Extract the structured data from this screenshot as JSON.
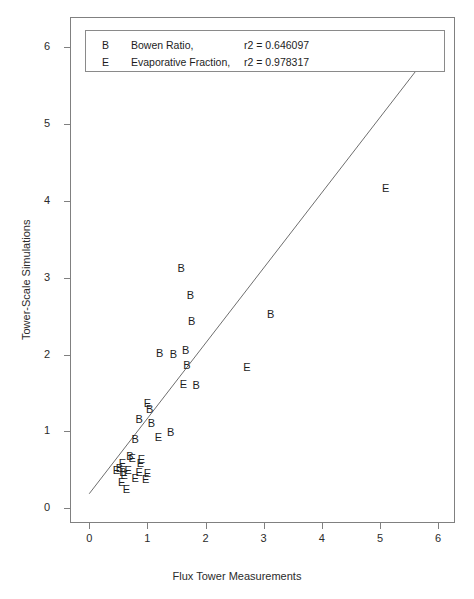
{
  "chart_data": {
    "type": "scatter",
    "title": "",
    "xlabel": "Flux Tower Measurements",
    "ylabel": "Tower-Scale Simulations",
    "xlim": [
      -0.33,
      6.29
    ],
    "ylim": [
      -0.19,
      6.39
    ],
    "xticks": [
      0,
      1,
      2,
      3,
      4,
      5,
      6
    ],
    "yticks": [
      0,
      1,
      2,
      3,
      4,
      5,
      6
    ],
    "xticklabels": [
      "0",
      "1",
      "2",
      "3",
      "4",
      "5",
      "6"
    ],
    "yticklabels": [
      "0",
      "1",
      "2",
      "3",
      "4",
      "5",
      "6"
    ],
    "grid": false,
    "legend_position": "top-left",
    "legend": [
      {
        "marker": "B",
        "label": "Bowen Ratio,",
        "stat": "r2 =  0.646097"
      },
      {
        "marker": "E",
        "label": "Evaporative Fraction,",
        "stat": "r2 =  0.978317"
      }
    ],
    "fit_line": {
      "x0": 0.0,
      "y0": 0.19,
      "x1": 5.65,
      "y1": 5.72
    },
    "series": [
      {
        "name": "Bowen Ratio",
        "marker": "B",
        "points": [
          [
            1.58,
            3.12
          ],
          [
            1.74,
            2.78
          ],
          [
            1.76,
            2.44
          ],
          [
            3.12,
            2.53
          ],
          [
            1.21,
            2.02
          ],
          [
            1.45,
            2.01
          ],
          [
            1.66,
            2.06
          ],
          [
            1.68,
            1.86
          ],
          [
            1.84,
            1.61
          ],
          [
            1.04,
            1.29
          ],
          [
            0.86,
            1.16
          ],
          [
            1.07,
            1.11
          ],
          [
            0.79,
            0.9
          ],
          [
            1.4,
            0.99
          ],
          [
            0.7,
            0.68
          ],
          [
            0.52,
            0.52
          ],
          [
            0.58,
            0.47
          ]
        ]
      },
      {
        "name": "Evaporative Fraction",
        "marker": "E",
        "points": [
          [
            5.1,
            4.16
          ],
          [
            2.71,
            1.84
          ],
          [
            1.62,
            1.62
          ],
          [
            1.0,
            1.37
          ],
          [
            1.19,
            0.93
          ],
          [
            0.74,
            0.66
          ],
          [
            0.9,
            0.64
          ],
          [
            0.57,
            0.59
          ],
          [
            0.88,
            0.59
          ],
          [
            0.47,
            0.5
          ],
          [
            0.67,
            0.5
          ],
          [
            0.86,
            0.47
          ],
          [
            1.0,
            0.46
          ],
          [
            0.6,
            0.43
          ],
          [
            0.79,
            0.4
          ],
          [
            0.97,
            0.38
          ],
          [
            0.56,
            0.34
          ],
          [
            0.64,
            0.25
          ]
        ]
      }
    ]
  }
}
